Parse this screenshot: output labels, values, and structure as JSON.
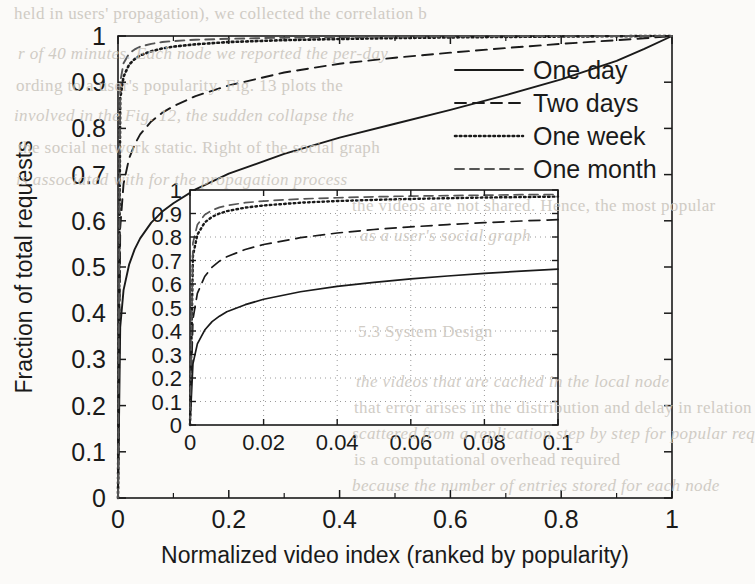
{
  "figure": {
    "kind": "scanned-paper-figure",
    "background_color": "#fbfaf8",
    "ink_color": "#1a1a1a",
    "faded_ink_color": "#555555"
  },
  "chart_data": {
    "type": "line",
    "title": "",
    "xlabel": "Normalized video index (ranked by popularity)",
    "ylabel": "Fraction of total requests",
    "xlim": [
      0,
      1
    ],
    "ylim": [
      0,
      1
    ],
    "xticks": [
      "0",
      "0.2",
      "0.4",
      "0.6",
      "0.8",
      "1"
    ],
    "xtick_values": [
      0,
      0.2,
      0.4,
      0.6,
      0.8,
      1
    ],
    "yticks": [
      "0",
      "0.1",
      "0.2",
      "0.3",
      "0.4",
      "0.5",
      "0.6",
      "0.7",
      "0.8",
      "0.9",
      "1"
    ],
    "ytick_values": [
      0,
      0.1,
      0.2,
      0.3,
      0.4,
      0.5,
      0.6,
      0.7,
      0.8,
      0.9,
      1
    ],
    "grid": false,
    "legend_position": "upper right",
    "series": [
      {
        "name": "One day",
        "style": "solid",
        "x": [
          0,
          0.004,
          0.01,
          0.02,
          0.03,
          0.04,
          0.06,
          0.08,
          0.1,
          0.14,
          0.2,
          0.3,
          0.4,
          0.5,
          0.6,
          0.7,
          0.8,
          0.9,
          0.95,
          1
        ],
        "y": [
          0,
          0.37,
          0.45,
          0.505,
          0.538,
          0.562,
          0.596,
          0.62,
          0.638,
          0.668,
          0.702,
          0.745,
          0.78,
          0.81,
          0.84,
          0.872,
          0.906,
          0.946,
          0.972,
          1
        ]
      },
      {
        "name": "Two days",
        "style": "dashed",
        "x": [
          0,
          0.004,
          0.01,
          0.02,
          0.03,
          0.04,
          0.06,
          0.08,
          0.1,
          0.14,
          0.2,
          0.3,
          0.4,
          0.5,
          0.6,
          0.7,
          0.8,
          0.9,
          0.95,
          1
        ],
        "y": [
          0,
          0.585,
          0.68,
          0.735,
          0.765,
          0.787,
          0.815,
          0.834,
          0.848,
          0.87,
          0.893,
          0.921,
          0.94,
          0.953,
          0.964,
          0.974,
          0.983,
          0.991,
          0.995,
          1
        ]
      },
      {
        "name": "One week",
        "style": "dotted",
        "x": [
          0,
          0.004,
          0.01,
          0.02,
          0.03,
          0.04,
          0.06,
          0.08,
          0.1,
          0.14,
          0.2,
          0.3,
          0.4,
          0.5,
          0.6,
          0.7,
          0.8,
          0.9,
          0.95,
          1
        ],
        "y": [
          0,
          0.865,
          0.912,
          0.938,
          0.95,
          0.958,
          0.967,
          0.973,
          0.977,
          0.982,
          0.987,
          0.991,
          0.9935,
          0.9955,
          0.997,
          0.998,
          0.9988,
          0.9995,
          0.9998,
          1
        ]
      },
      {
        "name": "One month",
        "style": "dashdot",
        "x": [
          0,
          0.004,
          0.01,
          0.02,
          0.03,
          0.04,
          0.06,
          0.08,
          0.1,
          0.14,
          0.2,
          0.3,
          0.4,
          0.5,
          0.6,
          0.7,
          0.8,
          0.9,
          0.95,
          1
        ],
        "y": [
          0,
          0.9,
          0.941,
          0.962,
          0.971,
          0.977,
          0.983,
          0.987,
          0.989,
          0.992,
          0.994,
          0.9963,
          0.9975,
          0.9984,
          0.999,
          0.9994,
          0.9997,
          0.9999,
          1,
          1
        ]
      }
    ],
    "legend": [
      {
        "label": "One day",
        "style": "solid"
      },
      {
        "label": "Two days",
        "style": "dashed"
      },
      {
        "label": "One week",
        "style": "dotted"
      },
      {
        "label": "One month",
        "style": "dashdot"
      }
    ],
    "inset": {
      "type": "line",
      "xlim": [
        0,
        0.1
      ],
      "ylim": [
        0,
        1
      ],
      "xticks": [
        "0",
        "0.02",
        "0.04",
        "0.06",
        "0.08",
        "0.1"
      ],
      "xtick_values": [
        0,
        0.02,
        0.04,
        0.06,
        0.08,
        0.1
      ],
      "yticks": [
        "0",
        "0.1",
        "0.2",
        "0.3",
        "0.4",
        "0.5",
        "0.6",
        "0.7",
        "0.8",
        "0.9",
        "1"
      ],
      "ytick_values": [
        0,
        0.1,
        0.2,
        0.3,
        0.4,
        0.5,
        0.6,
        0.7,
        0.8,
        0.9,
        1
      ],
      "grid": true,
      "series": [
        {
          "name": "One day",
          "style": "solid",
          "x": [
            0,
            0.0008,
            0.002,
            0.004,
            0.006,
            0.008,
            0.01,
            0.015,
            0.02,
            0.03,
            0.04,
            0.05,
            0.06,
            0.07,
            0.08,
            0.09,
            0.1
          ],
          "y": [
            0,
            0.26,
            0.345,
            0.404,
            0.44,
            0.463,
            0.482,
            0.512,
            0.535,
            0.567,
            0.59,
            0.607,
            0.622,
            0.634,
            0.645,
            0.655,
            0.663
          ]
        },
        {
          "name": "Two days",
          "style": "dashed",
          "x": [
            0,
            0.0008,
            0.002,
            0.004,
            0.006,
            0.008,
            0.01,
            0.015,
            0.02,
            0.03,
            0.04,
            0.05,
            0.06,
            0.07,
            0.08,
            0.09,
            0.1
          ],
          "y": [
            0,
            0.45,
            0.56,
            0.632,
            0.672,
            0.697,
            0.716,
            0.747,
            0.768,
            0.797,
            0.817,
            0.832,
            0.843,
            0.853,
            0.861,
            0.868,
            0.874
          ]
        },
        {
          "name": "One week",
          "style": "dotted",
          "x": [
            0,
            0.0008,
            0.002,
            0.004,
            0.006,
            0.008,
            0.01,
            0.015,
            0.02,
            0.03,
            0.04,
            0.05,
            0.06,
            0.07,
            0.08,
            0.09,
            0.1
          ],
          "y": [
            0,
            0.72,
            0.81,
            0.862,
            0.886,
            0.9,
            0.91,
            0.925,
            0.934,
            0.946,
            0.953,
            0.958,
            0.962,
            0.965,
            0.968,
            0.97,
            0.972
          ]
        },
        {
          "name": "One month",
          "style": "dashdot",
          "x": [
            0,
            0.0008,
            0.002,
            0.004,
            0.006,
            0.008,
            0.01,
            0.015,
            0.02,
            0.03,
            0.04,
            0.05,
            0.06,
            0.07,
            0.08,
            0.09,
            0.1
          ],
          "y": [
            0,
            0.775,
            0.852,
            0.895,
            0.914,
            0.926,
            0.934,
            0.946,
            0.953,
            0.962,
            0.967,
            0.971,
            0.974,
            0.976,
            0.978,
            0.98,
            0.981
          ]
        }
      ]
    }
  },
  "bleed_through": {
    "note": "Faint show-through text from the reverse page of the scan",
    "lines": [
      {
        "text": "held in users' propagation), we collected the correlation b",
        "x": 14,
        "y": 4
      },
      {
        "text": "r of 40 minutes. Each node we reported the per-day",
        "x": 18,
        "y": 44
      },
      {
        "text": "ording to a user's popularity. Fig. 13 plots the",
        "x": 16,
        "y": 76
      },
      {
        "text": "involved in the Fig. 12, the sudden collapse the",
        "x": 14,
        "y": 106
      },
      {
        "text": "the social network static. Right of the social graph",
        "x": 18,
        "y": 138
      },
      {
        "text": "is associated with for the propagation process",
        "x": 16,
        "y": 170
      },
      {
        "text": "the videos are not shared. Hence, the most popular",
        "x": 352,
        "y": 196
      },
      {
        "text": "as a user's social graph",
        "x": 360,
        "y": 226
      },
      {
        "text": "5.3 System Design",
        "x": 358,
        "y": 322
      },
      {
        "text": "the videos that are cached in the local node",
        "x": 356,
        "y": 372
      },
      {
        "text": "that error arises in the distribution and delay in relation",
        "x": 354,
        "y": 398
      },
      {
        "text": "scattered from a replication step by step for popular req",
        "x": 352,
        "y": 424
      },
      {
        "text": "is a computational overhead required",
        "x": 354,
        "y": 450
      },
      {
        "text": "because the number of entries stored for each node",
        "x": 352,
        "y": 476
      }
    ]
  }
}
